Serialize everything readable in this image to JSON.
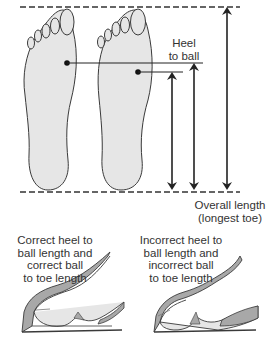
{
  "diagram": {
    "labels": {
      "heel_to_ball": "Heel\nto ball",
      "overall_length": "Overall length\n(longest toe)",
      "correct_caption": "Correct heel to\nball length and\ncorrect ball\nto toe length",
      "incorrect_caption": "Incorrect heel to\nball length and\nincorrect ball\nto toe length"
    },
    "colors": {
      "foot_fill": "#e6e6e6",
      "outline": "#3a3a3a",
      "shoe_fill": "#a8a8a8",
      "text": "#333333"
    }
  }
}
